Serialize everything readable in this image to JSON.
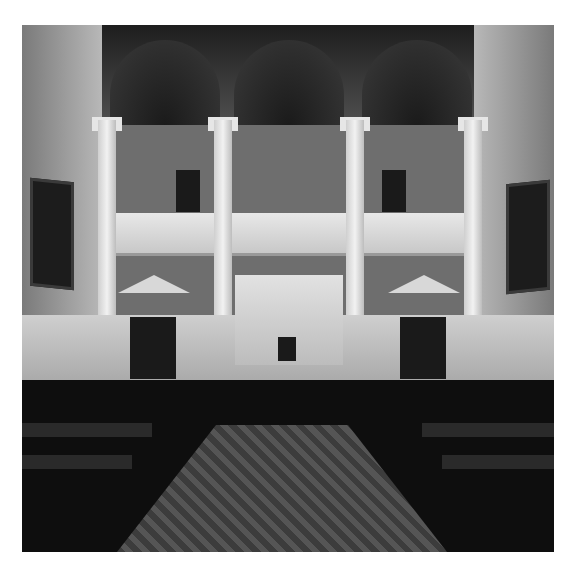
{
  "image": {
    "type": "photograph",
    "style": "black-and-white",
    "subject": "Legislative chamber interior",
    "description": "Symmetrical view down a carpeted center aisle toward a raised marble rostrum, flanked by rows of dark wooden desks and leather chairs; upper gallery with balustrade supported by marble columns under vaulted arches; framed portrait paintings on side walls.",
    "border_color": "#ffffff",
    "elements": [
      {
        "name": "vaulted-ceiling",
        "count": 3
      },
      {
        "name": "marble-columns",
        "count": 6
      },
      {
        "name": "upper-gallery-balcony",
        "count": 1
      },
      {
        "name": "gallery-doors",
        "count": 2
      },
      {
        "name": "pedimented-doors-lower",
        "count": 2
      },
      {
        "name": "portrait-paintings",
        "count": 2
      },
      {
        "name": "presiding-rostrum",
        "count": 1
      },
      {
        "name": "patterned-carpet-aisle",
        "count": 1
      },
      {
        "name": "member-desks-and-chairs",
        "count": "many"
      }
    ]
  }
}
